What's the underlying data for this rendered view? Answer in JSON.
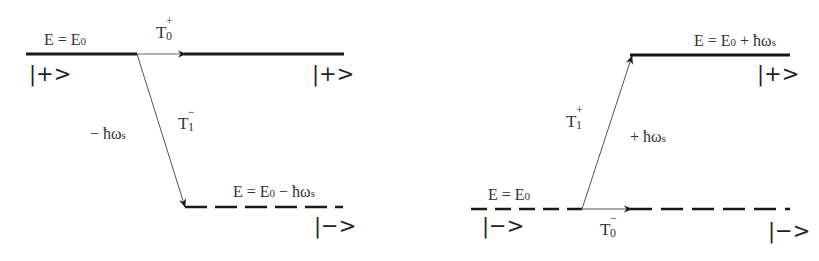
{
  "diagram": {
    "left_panel": {
      "upper_level": {
        "energy_label": "E = E",
        "energy_sub": "0",
        "energy_suffix": "",
        "state": "|+>",
        "state_right": "|+>",
        "style": "solid"
      },
      "lower_level": {
        "energy_label": "E = E",
        "energy_sub": "0",
        "energy_suffix": " − ħω",
        "energy_suffix_sub": "s",
        "state": "|−>",
        "style": "dashed"
      },
      "transition_horizontal": {
        "label": "T",
        "sup": "+",
        "sub": "0"
      },
      "transition_diagonal": {
        "label": "T",
        "sup": "−",
        "sub": "1",
        "energy_change": "− ħω",
        "energy_change_sub": "s"
      }
    },
    "right_panel": {
      "upper_level": {
        "energy_label": "E = E",
        "energy_sub": "0",
        "energy_suffix": " + ħω",
        "energy_suffix_sub": "s",
        "state": "|+>",
        "style": "solid"
      },
      "lower_level": {
        "energy_label": "E = E",
        "energy_sub": "0",
        "state": "|−>",
        "state_right": "|−>",
        "style": "dashed"
      },
      "transition_horizontal": {
        "label": "T",
        "sup": "−",
        "sub": "0"
      },
      "transition_diagonal": {
        "label": "T",
        "sup": "+",
        "sub": "1",
        "energy_change": "+ ħω",
        "energy_change_sub": "s"
      }
    },
    "colors": {
      "line": "#1a1a1a",
      "thin_line": "#555555"
    }
  }
}
